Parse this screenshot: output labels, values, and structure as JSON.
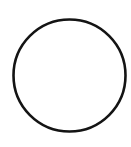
{
  "canvas": {
    "background_color": "#ffffff",
    "shape": {
      "kind": "circle-outline",
      "stroke_color": "#141414",
      "fill": "none",
      "stroke_width": "2.6",
      "center_x": "69.5",
      "center_y": "75.5",
      "radius": "56"
    }
  }
}
